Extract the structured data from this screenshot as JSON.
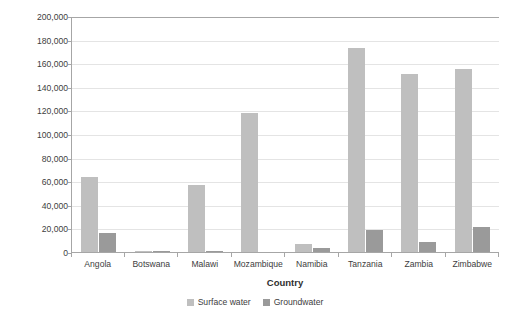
{
  "chart_data": {
    "type": "bar",
    "title": "",
    "subtitle": "",
    "xlabel": "Country",
    "ylabel": "Area of irrigated land (ha)",
    "categories": [
      "Angola",
      "Botswana",
      "Malawi",
      "Mozambique",
      "Namibia",
      "Tanzania",
      "Zambia",
      "Zimbabwe"
    ],
    "series": [
      {
        "name": "Surface water",
        "color": "#bfbfbf",
        "values": [
          63500,
          1200,
          57000,
          118000,
          6800,
          173000,
          151000,
          155000
        ]
      },
      {
        "name": "Groundwater",
        "color": "#9a9a9a",
        "values": [
          16000,
          900,
          700,
          0,
          3400,
          18500,
          8500,
          21500
        ]
      }
    ],
    "ylim": [
      0,
      200000
    ],
    "ytick_values": [
      0,
      20000,
      40000,
      60000,
      80000,
      100000,
      120000,
      140000,
      160000,
      180000,
      200000
    ],
    "ytick_labels": [
      "0",
      "20,000",
      "40,000",
      "60,000",
      "80,000",
      "100,000",
      "120,000",
      "140,000",
      "160,000",
      "180,000",
      "200,000"
    ],
    "grid": true,
    "grid_axis": "y",
    "legend_position": "bottom",
    "legend_entries": [
      "Surface water",
      "Groundwater"
    ]
  }
}
